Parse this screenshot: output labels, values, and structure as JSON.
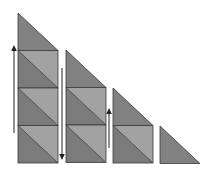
{
  "diagram": {
    "colors": {
      "background": "#ffffff",
      "triangle_dark": "#7b7b7b",
      "triangle_light": "#a2a2a2",
      "top_triangle": "#818181",
      "edge": "#3a3a3a",
      "arrow": "#222222"
    },
    "columns": [
      {
        "id": "column-1",
        "x": 18,
        "width": 40,
        "top": 13,
        "square_cells": 3
      },
      {
        "id": "column-2",
        "x": 66,
        "width": 40,
        "top": 50,
        "square_cells": 2
      },
      {
        "id": "column-3",
        "x": 113,
        "width": 40,
        "top": 88,
        "square_cells": 1
      },
      {
        "id": "column-4",
        "x": 160,
        "width": 40,
        "top": 126,
        "square_cells": 0
      }
    ],
    "cell_height": 37.5,
    "bottom": 163,
    "arrows": [
      {
        "id": "arrow-1",
        "direction": "up",
        "x": 14,
        "y_start": 133,
        "y_end": 45
      },
      {
        "id": "arrow-2",
        "direction": "down",
        "x": 62,
        "y_start": 68,
        "y_end": 160
      },
      {
        "id": "arrow-3",
        "direction": "up",
        "x": 109,
        "y_start": 148,
        "y_end": 108
      }
    ]
  }
}
